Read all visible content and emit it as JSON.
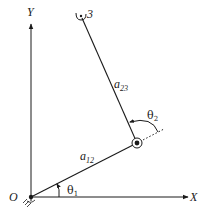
{
  "diagram": {
    "type": "two-link planar manipulator",
    "axes": {
      "x_label": "X",
      "y_label": "Y",
      "origin_label": "O"
    },
    "links": [
      {
        "name": "a",
        "sub": "12",
        "from": "O",
        "to": "joint-2"
      },
      {
        "name": "a",
        "sub": "23",
        "from": "joint-2",
        "to": "3"
      }
    ],
    "angles": [
      {
        "symbol": "θ",
        "sub": "1",
        "between": "X axis and link a12"
      },
      {
        "symbol": "θ",
        "sub": "2",
        "between": "extension of a12 and link a23"
      }
    ],
    "end_effector_label": "3",
    "colors": {
      "stroke": "#1a1a1a",
      "background": "#ffffff"
    }
  }
}
